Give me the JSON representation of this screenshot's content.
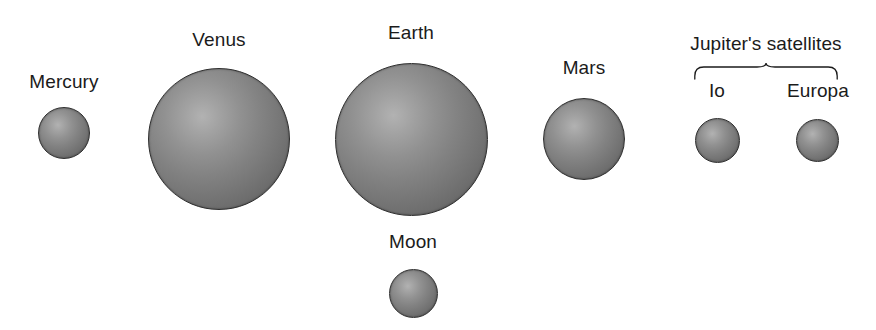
{
  "figure": {
    "background_color": "#ffffff",
    "sphere_edge_color": "#3c3c3c",
    "sphere_highlight_color": "#b2b2b2",
    "label_color": "#1b1b1b",
    "width": 876,
    "height": 330
  },
  "bodies": [
    {
      "name": "Mercury",
      "label": "Mercury",
      "cx": 64,
      "cy": 133,
      "diameter": 52,
      "label_cx": 64,
      "label_top": 71
    },
    {
      "name": "Venus",
      "label": "Venus",
      "cx": 219,
      "cy": 139,
      "diameter": 142,
      "label_cx": 219,
      "label_top": 29
    },
    {
      "name": "Earth",
      "label": "Earth",
      "cx": 411,
      "cy": 139,
      "diameter": 153,
      "label_cx": 411,
      "label_top": 22
    },
    {
      "name": "Mars",
      "label": "Mars",
      "cx": 584,
      "cy": 139,
      "diameter": 82,
      "label_cx": 584,
      "label_top": 57
    },
    {
      "name": "Io",
      "label": "Io",
      "cx": 717,
      "cy": 140,
      "diameter": 45,
      "label_cx": 717,
      "label_top": 80
    },
    {
      "name": "Europa",
      "label": "Europa",
      "cx": 817,
      "cy": 140,
      "diameter": 43,
      "label_cx": 818,
      "label_top": 80
    },
    {
      "name": "Moon",
      "label": "Moon",
      "cx": 413,
      "cy": 293,
      "diameter": 49,
      "label_cx": 413,
      "label_top": 231
    }
  ],
  "group_annotation": {
    "label": "Jupiter's satellites",
    "label_cx": 766,
    "label_top": 33,
    "brace_left": 694,
    "brace_right": 838,
    "brace_top": 62,
    "brace_height": 18,
    "members": [
      "Io",
      "Europa"
    ]
  }
}
